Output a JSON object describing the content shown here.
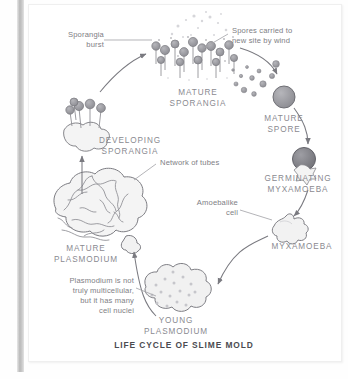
{
  "figure": {
    "title": "LIFE CYCLE OF SLIME MOLD"
  },
  "annotations": [
    {
      "id": "sporangia-burst",
      "text": "Sporangia\nburst",
      "align": "right"
    },
    {
      "id": "spores-wind",
      "text": "Spores carried to\nnew site by wind",
      "align": "left"
    },
    {
      "id": "network-tubes",
      "text": "Network of tubes",
      "align": "left"
    },
    {
      "id": "amoebalike-cell",
      "text": "Amoebalike\ncell",
      "align": "right"
    },
    {
      "id": "plasmodium-note",
      "text": "Plasmodium is not\ntruly multicellular,\nbut it has many\ncell nuclei",
      "align": "right"
    }
  ],
  "stages": [
    {
      "id": "mature-sporangia",
      "label": "MATURE\nSPORANGIA"
    },
    {
      "id": "mature-spore",
      "label": "MATURE\nSPORE"
    },
    {
      "id": "germinating-myxamoeba",
      "label": "GERMINATING\nMYXAMOEBA"
    },
    {
      "id": "myxamoeba",
      "label": "MYXAMOEBA"
    },
    {
      "id": "young-plasmodium",
      "label": "YOUNG\nPLASMODIUM"
    },
    {
      "id": "mature-plasmodium",
      "label": "MATURE\nPLASMODIUM"
    },
    {
      "id": "developing-sporangia",
      "label": "DEVELOPING\nSPORANGIA"
    }
  ],
  "colors": {
    "ink": "#6f6f75",
    "label_text": "#7e7e84",
    "caption_text": "#8a8a90",
    "title_text": "#4b4b50",
    "spore_fill": "#9a9a9f",
    "spore_dark": "#76767c",
    "body_fill": "#f0f0f0",
    "gutter": "#b9b9b9"
  }
}
